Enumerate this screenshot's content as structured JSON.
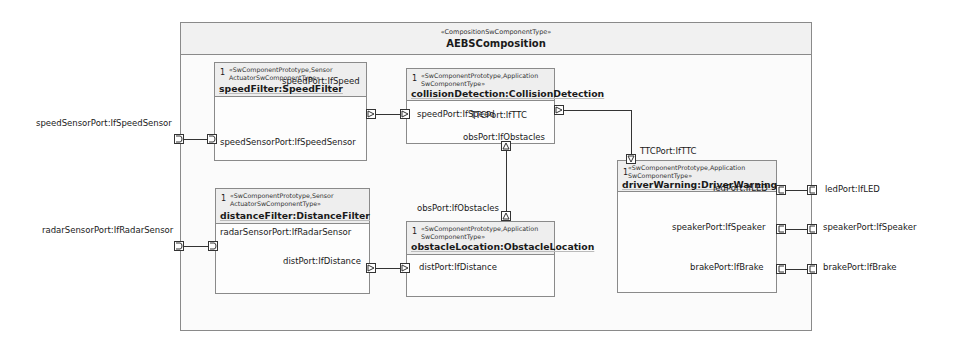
{
  "composition": {
    "stereotype": "«CompositionSwComponentType»",
    "name": "AEBSComposition"
  },
  "outer_ports": {
    "speedSensor": "speedSensorPort:IfSpeedSensor",
    "radarSensor": "radarSensorPort:IfRadarSensor",
    "led": "ledPort:IfLED",
    "speaker": "speakerPort:IfSpeaker",
    "brake": "brakePort:IfBrake"
  },
  "components": {
    "speedFilter": {
      "multiplicity": "1",
      "stereotype_line1": "«SwComponentPrototype,Sensor",
      "stereotype_line2": "ActuatorSwComponentType»",
      "name": "speedFilter:SpeedFilter",
      "ports": {
        "speedPort": "speedPort:IfSpeed",
        "speedSensorPort": "speedSensorPort:IfSpeedSensor"
      }
    },
    "collisionDetection": {
      "multiplicity": "1",
      "stereotype_line1": "«SwComponentPrototype,Application",
      "stereotype_line2": "SwComponentType»",
      "name": "collisionDetection:CollisionDetection",
      "ports": {
        "speedPort": "speedPort:IfSpeed",
        "ttcPort": "TTCPort:IfTTC",
        "obsPort": "obsPort:IfObstacles"
      }
    },
    "distanceFilter": {
      "multiplicity": "1",
      "stereotype_line1": "«SwComponentPrototype,Sensor",
      "stereotype_line2": "ActuatorSwComponentType»",
      "name": "distanceFilter:DistanceFilter",
      "ports": {
        "radarSensorPort": "radarSensorPort:IfRadarSensor",
        "distPort": "distPort:IfDistance"
      }
    },
    "obstacleLocation": {
      "multiplicity": "1",
      "stereotype_line1": "«SwComponentPrototype,Application",
      "stereotype_line2": "SwComponentType»",
      "name": "obstacleLocation:ObstacleLocation",
      "ports": {
        "obsPort": "obsPort:IfObstacles",
        "distPort": "distPort:IfDistance"
      }
    },
    "driverWarning": {
      "multiplicity": "1",
      "stereotype_line1": "«SwComponentPrototype,Application",
      "stereotype_line2": "SwComponentType»",
      "name": "driverWarning:DriverWarning",
      "ports": {
        "ttcPort": "TTCPort:IfTTC",
        "ledPort": "ledPort:IfLED",
        "speakerPort": "speakerPort:IfSpeaker",
        "brakePort": "brakePort:IfBrake"
      }
    }
  }
}
